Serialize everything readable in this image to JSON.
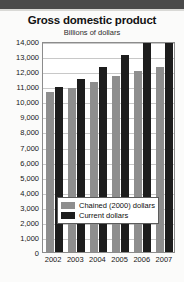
{
  "chart_data": {
    "type": "bar",
    "title": "Gross domestic product",
    "subtitle": "Billions of dollars",
    "xlabel": "",
    "ylabel": "Billions of dollars",
    "categories": [
      "2002",
      "2003",
      "2004",
      "2005",
      "2006",
      "2007"
    ],
    "series": [
      {
        "name": "Chained (2000) dollars",
        "color": "#8e8e8e",
        "values": [
          10642,
          10912,
          11295,
          11649,
          11987,
          12306
        ]
      },
      {
        "name": "Current dollars",
        "color": "#1d1d1d",
        "values": [
          10980,
          11512,
          12277,
          13095,
          13856,
          13841
        ]
      }
    ],
    "ylim": [
      0,
      14000
    ],
    "ytick_step": 1000,
    "ytick_labels": [
      "14,000",
      "13,000",
      "12,000",
      "11,000",
      "10,000",
      "9,000",
      "8,000",
      "7,000",
      "6,000",
      "5,000",
      "4,000",
      "3,000",
      "2,000",
      "1,000",
      "0"
    ],
    "grid": true,
    "legend_position": "center-lower"
  },
  "legend": {
    "entries": [
      {
        "label": "Chained (2000) dollars"
      },
      {
        "label": "Current dollars"
      }
    ]
  }
}
